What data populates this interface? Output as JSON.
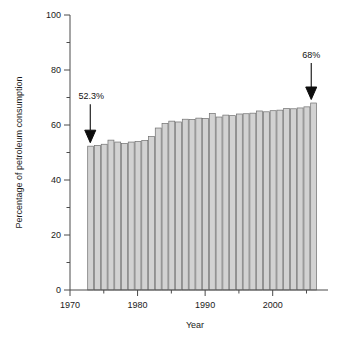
{
  "chart_data": {
    "type": "bar",
    "title": "",
    "xlabel": "Year",
    "ylabel": "Percentage of petroleum consumption",
    "xlim": [
      1970,
      2007
    ],
    "ylim": [
      0,
      100
    ],
    "grid": false,
    "legend": "none",
    "y_ticks_major": [
      0,
      20,
      40,
      60,
      80,
      100
    ],
    "y_ticks_minor": [
      10,
      30,
      50,
      70,
      90
    ],
    "x_ticks_major": [
      1970,
      1980,
      1990,
      2000
    ],
    "x_ticks_minor": [
      1975,
      1985,
      1995,
      2005
    ],
    "x_tick_labels": [
      "1970",
      "1980",
      "1990",
      "2000"
    ],
    "y_tick_labels": [
      "0",
      "20",
      "40",
      "60",
      "80",
      "100"
    ],
    "categories": [
      1973,
      1974,
      1975,
      1976,
      1977,
      1978,
      1979,
      1980,
      1981,
      1982,
      1983,
      1984,
      1985,
      1986,
      1987,
      1988,
      1989,
      1990,
      1991,
      1992,
      1993,
      1994,
      1995,
      1996,
      1997,
      1998,
      1999,
      2000,
      2001,
      2002,
      2003,
      2004,
      2005,
      2006
    ],
    "values": [
      52.3,
      52.6,
      53.0,
      54.5,
      53.8,
      53.3,
      53.8,
      54.0,
      54.4,
      55.8,
      58.9,
      60.6,
      61.4,
      61.1,
      62.1,
      62.0,
      62.5,
      62.4,
      64.2,
      62.9,
      63.6,
      63.4,
      64.0,
      64.1,
      64.3,
      65.1,
      64.8,
      65.2,
      65.4,
      66.0,
      65.9,
      66.2,
      66.6,
      68.0
    ],
    "bar_color": "#d2d2d2",
    "bar_edge_color": "#6f6f6f",
    "annotations": [
      {
        "label": "52.3%",
        "year": 1973,
        "value": 52.3
      },
      {
        "label": "68%",
        "year": 2006,
        "value": 68.0
      }
    ]
  },
  "labels": {
    "y_axis_title": "Percentage of petroleum consumption",
    "x_axis_title": "Year",
    "annotation_start": "52.3%",
    "annotation_end": "68%"
  }
}
